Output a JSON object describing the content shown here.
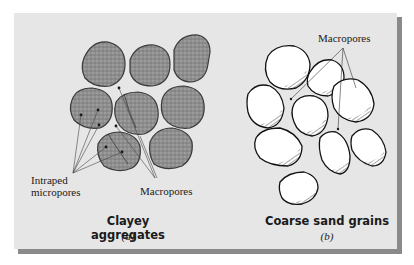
{
  "figure": {
    "panel_color": "#e6e6e6",
    "shadow_color": "#8a8a8a",
    "clay_fill": "#8f8f8f",
    "grain_fill": "#ffffff"
  },
  "panel_a": {
    "title": "Clayey aggregates",
    "sublabel": "(a)",
    "labels": {
      "intraped": [
        "Intraped",
        "micropores"
      ],
      "macropores": "Macropores"
    }
  },
  "panel_b": {
    "title": "Coarse sand grains",
    "sublabel": "(b)",
    "labels": {
      "macropores": "Macropores"
    }
  }
}
